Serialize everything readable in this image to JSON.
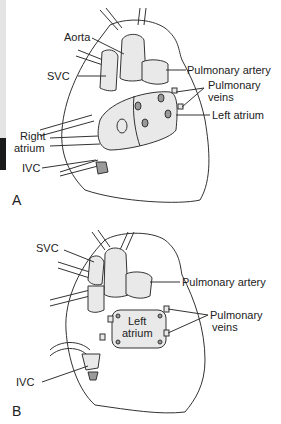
{
  "figure": {
    "panel_a": {
      "letter": "A",
      "labels": {
        "aorta": "Aorta",
        "svc": "SVC",
        "pulmonary_artery": "Pulmonary artery",
        "pulmonary_veins_1": "Pulmonary",
        "pulmonary_veins_2": "veins",
        "left_atrium": "Left atrium",
        "right_atrium_1": "Right",
        "right_atrium_2": "atrium",
        "ivc": "IVC"
      }
    },
    "panel_b": {
      "letter": "B",
      "labels": {
        "svc": "SVC",
        "pulmonary_artery": "Pulmonary artery",
        "left_atrium_1": "Left",
        "left_atrium_2": "atrium",
        "pulmonary_veins_1": "Pulmonary",
        "pulmonary_veins_2": "veins",
        "ivc": "IVC"
      }
    }
  },
  "colors": {
    "ink": "#333333",
    "edge_gray": "#e4e4e4",
    "edge_dark": "#1a1a1a"
  }
}
